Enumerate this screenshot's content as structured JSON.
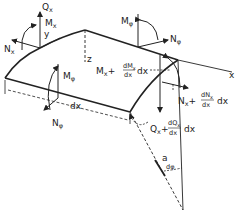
{
  "diagram": {
    "axes": {
      "x": "x",
      "y": "y",
      "z": "z"
    },
    "labels": {
      "Qx": "Q",
      "Qx_sub": "x",
      "Mx": "M",
      "Mx_sub": "x",
      "Nx": "N",
      "Nx_sub": "x",
      "Mphi_top": "M",
      "Mphi_top_sub": "φ",
      "Nphi_top": "N",
      "Nphi_top_sub": "φ",
      "Mphi_front": "M",
      "Mphi_front_sub": "φ",
      "Nphi_front": "N",
      "Nphi_front_sub": "φ",
      "Mx_plus": "M",
      "Mx_plus_sub": "x",
      "Mx_plus_op": "+",
      "Mx_plus_num": "dM",
      "Mx_plus_num_sub": "x",
      "Mx_plus_den": "dx",
      "Mx_plus_tail": "dx",
      "Nx_plus": "N",
      "Nx_plus_sub": "x",
      "Nx_plus_op": "+",
      "Nx_plus_num": "dN",
      "Nx_plus_num_sub": "x",
      "Nx_plus_den": "dx",
      "Nx_plus_tail": "dx",
      "Qx_plus": "Q",
      "Qx_plus_sub": "x",
      "Qx_plus_op": "+",
      "Qx_plus_num": "dQ",
      "Qx_plus_num_sub": "x",
      "Qx_plus_den": "dx",
      "Qx_plus_tail": "dx",
      "dx": "dx",
      "radius": "a",
      "dphi": "dφ"
    },
    "colors": {
      "ink": "#222222",
      "background": "#ffffff"
    }
  }
}
